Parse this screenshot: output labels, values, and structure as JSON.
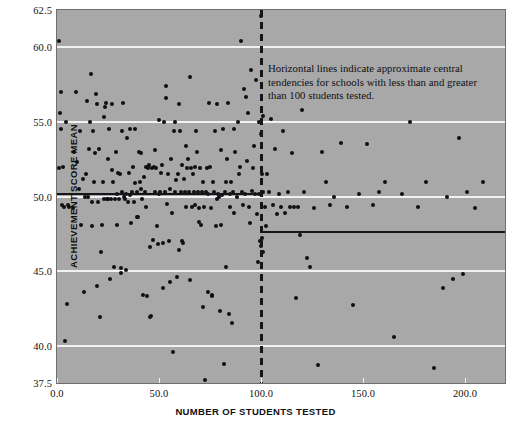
{
  "figure": {
    "background_color": "#ffffff",
    "panel_color": "#a8a8a8",
    "gridline_color": "#f2f2f2",
    "point_color": "#101014",
    "refline_color": "#16161a"
  },
  "annotation": {
    "text": "Horizontal lines indicate approximate central tendencies for schools with less than and greater than 100 students tested."
  },
  "chart_data": {
    "type": "scatter",
    "title": "",
    "xlabel": "NUMBER OF STUDENTS TESTED",
    "ylabel": "ACHIEVEMENT SCORE MEAN",
    "xlim": [
      0.0,
      219.6
    ],
    "ylim": [
      37.5,
      62.5
    ],
    "xticks": [
      0.0,
      50.0,
      100.0,
      150.0,
      200.0
    ],
    "xtick_labels": [
      "0.0",
      "50.0",
      "100.0",
      "150.0",
      "200.0"
    ],
    "yticks": [
      37.5,
      40.0,
      45.0,
      50.0,
      55.0,
      60.0,
      62.5
    ],
    "ytick_labels": [
      "37.5",
      "40.0",
      "45.0",
      "50.0",
      "55.0",
      "60.0",
      "62.5"
    ],
    "gridlines_y": [
      40.0,
      45.0,
      50.0,
      55.0,
      60.0
    ],
    "grid": true,
    "legend": "none",
    "marker": "filled-circle",
    "marker_size": 4,
    "reference_lines": [
      {
        "name": "central-tendency-under-100",
        "y": 50.2,
        "x_start": 0.0,
        "x_end": 100.0
      },
      {
        "name": "central-tendency-over-100",
        "y": 47.6,
        "x_start": 100.0,
        "x_end": 219.6
      }
    ],
    "divider_line": {
      "name": "students-tested-100-divider",
      "x": 100.0,
      "style": "dashed"
    },
    "points": [
      [
        0.8,
        60.4
      ],
      [
        1.2,
        51.9
      ],
      [
        1.5,
        55.6
      ],
      [
        2.0,
        57.0
      ],
      [
        2.2,
        54.5
      ],
      [
        2.4,
        49.4
      ],
      [
        3.0,
        52.0
      ],
      [
        3.4,
        49.3
      ],
      [
        3.8,
        40.3
      ],
      [
        4.5,
        55.0
      ],
      [
        4.8,
        42.8
      ],
      [
        5.2,
        49.4
      ],
      [
        6.0,
        49.3
      ],
      [
        8.0,
        49.2
      ],
      [
        8.5,
        53.0
      ],
      [
        9.5,
        57.0
      ],
      [
        10.0,
        52.3
      ],
      [
        11.0,
        50.5
      ],
      [
        11.5,
        54.4
      ],
      [
        12.0,
        48.1
      ],
      [
        12.5,
        51.2
      ],
      [
        13.0,
        43.6
      ],
      [
        13.5,
        50.0
      ],
      [
        14.0,
        51.5
      ],
      [
        14.5,
        56.4
      ],
      [
        15.0,
        50.0
      ],
      [
        15.5,
        53.2
      ],
      [
        16.0,
        55.0
      ],
      [
        16.6,
        58.2
      ],
      [
        17.0,
        49.6
      ],
      [
        17.4,
        48.0
      ],
      [
        17.8,
        54.4
      ],
      [
        18.2,
        51.0
      ],
      [
        18.6,
        52.9
      ],
      [
        19.0,
        56.9
      ],
      [
        19.4,
        56.2
      ],
      [
        19.8,
        44.0
      ],
      [
        20.2,
        49.6
      ],
      [
        20.6,
        53.2
      ],
      [
        21.0,
        41.9
      ],
      [
        21.5,
        46.3
      ],
      [
        22.0,
        48.1
      ],
      [
        22.4,
        51.0
      ],
      [
        22.8,
        49.8
      ],
      [
        23.2,
        55.3
      ],
      [
        23.6,
        56.0
      ],
      [
        24.0,
        56.3
      ],
      [
        24.4,
        49.8
      ],
      [
        24.8,
        52.5
      ],
      [
        25.2,
        49.8
      ],
      [
        25.6,
        54.5
      ],
      [
        26.0,
        44.5
      ],
      [
        26.4,
        49.8
      ],
      [
        26.8,
        51.8
      ],
      [
        27.2,
        56.2
      ],
      [
        27.6,
        51.0
      ],
      [
        28.0,
        45.3
      ],
      [
        28.4,
        49.8
      ],
      [
        28.8,
        53.0
      ],
      [
        29.2,
        50.2
      ],
      [
        29.6,
        48.1
      ],
      [
        30.0,
        51.6
      ],
      [
        30.4,
        49.8
      ],
      [
        30.8,
        51.5
      ],
      [
        31.2,
        45.2
      ],
      [
        31.4,
        44.9
      ],
      [
        31.8,
        50.3
      ],
      [
        32.0,
        54.4
      ],
      [
        32.4,
        56.3
      ],
      [
        32.8,
        50.0
      ],
      [
        33.2,
        49.8
      ],
      [
        33.6,
        45.1
      ],
      [
        34.0,
        50.2
      ],
      [
        34.4,
        53.9
      ],
      [
        34.8,
        49.6
      ],
      [
        35.2,
        51.6
      ],
      [
        35.6,
        54.5
      ],
      [
        36.0,
        50.1
      ],
      [
        36.4,
        48.2
      ],
      [
        36.8,
        50.3
      ],
      [
        37.2,
        52.0
      ],
      [
        37.6,
        49.6
      ],
      [
        38.0,
        50.9
      ],
      [
        38.4,
        54.5
      ],
      [
        39.0,
        48.6
      ],
      [
        39.4,
        50.3
      ],
      [
        39.8,
        48.6
      ],
      [
        40.2,
        53.0
      ],
      [
        40.6,
        51.0
      ],
      [
        41.0,
        50.5
      ],
      [
        41.4,
        52.9
      ],
      [
        41.8,
        49.8
      ],
      [
        42.2,
        43.4
      ],
      [
        42.6,
        51.3
      ],
      [
        43.0,
        50.3
      ],
      [
        43.4,
        49.3
      ],
      [
        43.8,
        52.0
      ],
      [
        44.0,
        43.3
      ],
      [
        44.4,
        51.9
      ],
      [
        44.6,
        52.0
      ],
      [
        45.0,
        52.1
      ],
      [
        45.4,
        46.6
      ],
      [
        45.8,
        41.9
      ],
      [
        46.2,
        42.0
      ],
      [
        46.6,
        51.9
      ],
      [
        47.0,
        47.1
      ],
      [
        47.4,
        52.0
      ],
      [
        47.8,
        50.3
      ],
      [
        48.2,
        53.1
      ],
      [
        48.6,
        51.9
      ],
      [
        49.0,
        48.0
      ],
      [
        49.4,
        46.8
      ],
      [
        49.8,
        50.2
      ],
      [
        50.2,
        55.1
      ],
      [
        50.6,
        50.3
      ],
      [
        51.0,
        51.6
      ],
      [
        51.4,
        52.1
      ],
      [
        51.8,
        46.9
      ],
      [
        52.2,
        43.9
      ],
      [
        52.4,
        55.0
      ],
      [
        52.8,
        50.3
      ],
      [
        53.2,
        57.4
      ],
      [
        53.6,
        56.6
      ],
      [
        54.0,
        49.5
      ],
      [
        54.4,
        51.5
      ],
      [
        54.8,
        47.0
      ],
      [
        55.2,
        50.5
      ],
      [
        55.6,
        44.3
      ],
      [
        56.0,
        52.5
      ],
      [
        56.4,
        48.9
      ],
      [
        56.8,
        39.6
      ],
      [
        57.2,
        54.4
      ],
      [
        57.6,
        55.0
      ],
      [
        58.0,
        50.3
      ],
      [
        58.4,
        51.1
      ],
      [
        58.8,
        44.6
      ],
      [
        59.2,
        51.5
      ],
      [
        59.6,
        46.4
      ],
      [
        60.0,
        56.2
      ],
      [
        60.4,
        54.4
      ],
      [
        60.8,
        50.3
      ],
      [
        61.2,
        52.1
      ],
      [
        61.4,
        47.0
      ],
      [
        61.8,
        46.9
      ],
      [
        62.2,
        51.2
      ],
      [
        62.6,
        50.3
      ],
      [
        63.0,
        53.4
      ],
      [
        63.4,
        49.3
      ],
      [
        63.8,
        51.9
      ],
      [
        64.2,
        52.5
      ],
      [
        64.6,
        50.3
      ],
      [
        65.0,
        44.4
      ],
      [
        65.4,
        58.0
      ],
      [
        65.8,
        51.9
      ],
      [
        66.2,
        49.3
      ],
      [
        66.6,
        51.5
      ],
      [
        67.0,
        50.3
      ],
      [
        67.4,
        49.4
      ],
      [
        67.8,
        52.0
      ],
      [
        68.2,
        54.4
      ],
      [
        68.6,
        53.0
      ],
      [
        69.0,
        50.3
      ],
      [
        69.4,
        49.2
      ],
      [
        69.8,
        48.3
      ],
      [
        70.2,
        51.9
      ],
      [
        70.6,
        48.1
      ],
      [
        71.0,
        50.3
      ],
      [
        71.4,
        42.6
      ],
      [
        71.8,
        51.0
      ],
      [
        72.2,
        49.3
      ],
      [
        72.6,
        37.7
      ],
      [
        73.0,
        50.3
      ],
      [
        73.4,
        51.9
      ],
      [
        73.8,
        43.6
      ],
      [
        74.2,
        50.2
      ],
      [
        74.6,
        56.3
      ],
      [
        75.0,
        52.0
      ],
      [
        75.4,
        49.2
      ],
      [
        75.8,
        43.4
      ],
      [
        76.2,
        43.3
      ],
      [
        76.6,
        51.0
      ],
      [
        77.0,
        50.3
      ],
      [
        77.4,
        54.4
      ],
      [
        77.8,
        48.0
      ],
      [
        78.2,
        49.8
      ],
      [
        78.6,
        56.2
      ],
      [
        79.0,
        50.2
      ],
      [
        79.4,
        50.0
      ],
      [
        79.8,
        42.3
      ],
      [
        80.2,
        53.1
      ],
      [
        80.6,
        48.1
      ],
      [
        81.0,
        50.1
      ],
      [
        81.4,
        54.5
      ],
      [
        81.8,
        38.8
      ],
      [
        82.2,
        50.3
      ],
      [
        82.6,
        45.3
      ],
      [
        83.0,
        51.0
      ],
      [
        83.4,
        52.5
      ],
      [
        83.8,
        56.3
      ],
      [
        84.2,
        42.1
      ],
      [
        84.6,
        50.2
      ],
      [
        85.0,
        49.3
      ],
      [
        85.4,
        51.0
      ],
      [
        85.8,
        41.5
      ],
      [
        86.2,
        50.3
      ],
      [
        86.6,
        54.5
      ],
      [
        87.0,
        48.9
      ],
      [
        87.4,
        53.0
      ],
      [
        88.0,
        50.0
      ],
      [
        88.6,
        55.0
      ],
      [
        89.2,
        51.5
      ],
      [
        89.8,
        52.0
      ],
      [
        90.2,
        60.4
      ],
      [
        90.6,
        50.3
      ],
      [
        91.0,
        49.4
      ],
      [
        91.5,
        57.2
      ],
      [
        92.0,
        50.2
      ],
      [
        92.5,
        56.7
      ],
      [
        93.0,
        52.4
      ],
      [
        93.5,
        55.6
      ],
      [
        94.0,
        49.3
      ],
      [
        94.5,
        48.2
      ],
      [
        95.0,
        58.5
      ],
      [
        95.5,
        50.4
      ],
      [
        96.0,
        51.9
      ],
      [
        96.5,
        53.4
      ],
      [
        97.0,
        50.2
      ],
      [
        97.5,
        57.8
      ],
      [
        98.0,
        48.8
      ],
      [
        98.4,
        45.6
      ],
      [
        98.8,
        55.0
      ],
      [
        99.2,
        50.2
      ],
      [
        99.6,
        47.0
      ],
      [
        99.8,
        46.7
      ],
      [
        100.0,
        62.1
      ],
      [
        100.2,
        54.2
      ],
      [
        100.4,
        47.2
      ],
      [
        100.6,
        51.5
      ],
      [
        100.8,
        50.3
      ],
      [
        101.0,
        46.3
      ],
      [
        101.2,
        55.4
      ],
      [
        102.0,
        49.3
      ],
      [
        102.5,
        48.0
      ],
      [
        103.0,
        51.5
      ],
      [
        104.0,
        50.3
      ],
      [
        105.0,
        55.2
      ],
      [
        106.0,
        49.4
      ],
      [
        107.0,
        53.2
      ],
      [
        108.0,
        48.8
      ],
      [
        109.0,
        50.2
      ],
      [
        110.0,
        49.3
      ],
      [
        111.0,
        54.4
      ],
      [
        112.0,
        48.9
      ],
      [
        113.0,
        50.3
      ],
      [
        114.0,
        49.3
      ],
      [
        115.0,
        52.9
      ],
      [
        116.0,
        49.3
      ],
      [
        117.0,
        43.2
      ],
      [
        118.0,
        49.3
      ],
      [
        119.0,
        47.4
      ],
      [
        120.0,
        55.8
      ],
      [
        121.0,
        50.3
      ],
      [
        122.5,
        45.9
      ],
      [
        124.0,
        45.3
      ],
      [
        126.0,
        49.2
      ],
      [
        128.0,
        38.7
      ],
      [
        130.0,
        53.0
      ],
      [
        132.0,
        51.0
      ],
      [
        134.0,
        49.4
      ],
      [
        136.0,
        50.0
      ],
      [
        139.0,
        53.6
      ],
      [
        142.0,
        49.3
      ],
      [
        145.0,
        42.7
      ],
      [
        148.0,
        50.2
      ],
      [
        152.0,
        53.5
      ],
      [
        155.0,
        49.4
      ],
      [
        158.0,
        50.3
      ],
      [
        161.0,
        51.0
      ],
      [
        165.0,
        40.6
      ],
      [
        169.0,
        50.2
      ],
      [
        173.0,
        55.0
      ],
      [
        177.0,
        49.3
      ],
      [
        181.0,
        51.0
      ],
      [
        185.0,
        38.5
      ],
      [
        189.0,
        43.9
      ],
      [
        191.0,
        50.0
      ],
      [
        194.0,
        44.5
      ],
      [
        197.0,
        53.9
      ],
      [
        199.0,
        44.8
      ],
      [
        201.0,
        50.3
      ],
      [
        205.0,
        49.2
      ],
      [
        209.0,
        51.0
      ]
    ]
  }
}
